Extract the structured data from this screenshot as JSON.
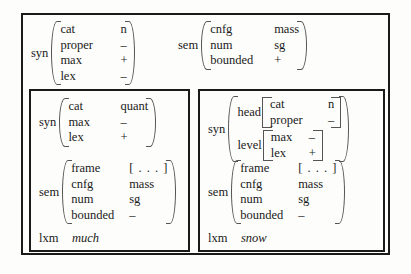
{
  "diagram": {
    "outer": {
      "syn": {
        "label": "syn",
        "rows": [
          {
            "attr": "cat",
            "val": "n"
          },
          {
            "attr": "proper",
            "val": "–"
          },
          {
            "attr": "max",
            "val": "+"
          },
          {
            "attr": "lex",
            "val": "–"
          }
        ]
      },
      "sem": {
        "label": "sem",
        "rows": [
          {
            "attr": "cnfg",
            "val": "mass"
          },
          {
            "attr": "num",
            "val": "sg"
          },
          {
            "attr": "bounded",
            "val": "+"
          }
        ]
      }
    },
    "left_box": {
      "syn": {
        "label": "syn",
        "rows": [
          {
            "attr": "cat",
            "val": "quant"
          },
          {
            "attr": "max",
            "val": "–"
          },
          {
            "attr": "lex",
            "val": "+"
          }
        ]
      },
      "sem": {
        "label": "sem",
        "rows": [
          {
            "attr": "frame",
            "val": "[ . . . ]"
          },
          {
            "attr": "cnfg",
            "val": "mass"
          },
          {
            "attr": "num",
            "val": "sg"
          },
          {
            "attr": "bounded",
            "val": "–"
          }
        ]
      },
      "lxm": {
        "label": "lxm",
        "word": "much"
      }
    },
    "right_box": {
      "syn": {
        "label": "syn",
        "head": {
          "label": "head",
          "rows": [
            {
              "attr": "cat",
              "val": "n"
            },
            {
              "attr": "proper",
              "val": "–"
            }
          ]
        },
        "level": {
          "label": "level",
          "rows": [
            {
              "attr": "max",
              "val": "–"
            },
            {
              "attr": "lex",
              "val": "+"
            }
          ]
        }
      },
      "sem": {
        "label": "sem",
        "rows": [
          {
            "attr": "frame",
            "val": "[ . . . ]"
          },
          {
            "attr": "cnfg",
            "val": "mass"
          },
          {
            "attr": "num",
            "val": "sg"
          },
          {
            "attr": "bounded",
            "val": "–"
          }
        ]
      },
      "lxm": {
        "label": "lxm",
        "word": "snow"
      }
    }
  }
}
